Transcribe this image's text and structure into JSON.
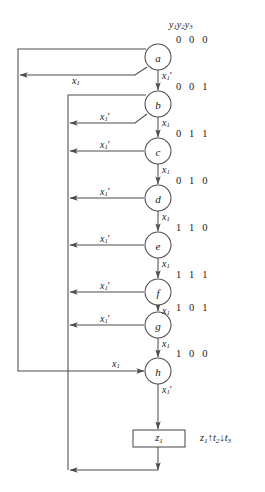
{
  "header": {
    "state_vars": "y1y2y3"
  },
  "nodes": [
    {
      "id": "a",
      "label": "a",
      "code": "0 0 0",
      "cx": 158,
      "cy": 57,
      "r": 13
    },
    {
      "id": "b",
      "label": "b",
      "code": "0 0 1",
      "cx": 158,
      "cy": 104,
      "r": 13
    },
    {
      "id": "c",
      "label": "c",
      "code": "0 1 1",
      "cx": 158,
      "cy": 151,
      "r": 13
    },
    {
      "id": "d",
      "label": "d",
      "code": "0 1 0",
      "cx": 158,
      "cy": 198,
      "r": 13
    },
    {
      "id": "e",
      "label": "e",
      "code": "1 1 0",
      "cx": 158,
      "cy": 245,
      "r": 13
    },
    {
      "id": "f",
      "label": "f",
      "code": "1 1 1",
      "cx": 158,
      "cy": 292,
      "r": 13
    },
    {
      "id": "g",
      "label": "g",
      "code": "1 0 1",
      "cx": 158,
      "cy": 325,
      "r": 13
    },
    {
      "id": "h",
      "label": "h",
      "code": "1 0 0",
      "cx": 158,
      "cy": 371,
      "r": 13
    }
  ],
  "output_box": {
    "label": "z1",
    "x": 133,
    "y": 430,
    "w": 52,
    "h": 17
  },
  "annotation": {
    "text": "z1 up t2 down t3",
    "z": "z",
    "zsub": "1",
    "t2": "t",
    "t2sub": "2",
    "t3": "t",
    "t3sub": "3",
    "up": "↑",
    "down": "↓"
  },
  "edge_labels": {
    "a_to_b": "x1'",
    "a_back": "x1",
    "b_to_c": "x1",
    "b_back": "x1'",
    "c_to_d": "x1",
    "c_back": "x1'",
    "d_to_e": "x1",
    "d_back": "x1'",
    "e_to_f": "x1",
    "e_back": "x1'",
    "f_to_g": "x1",
    "f_back": "x1'",
    "g_to_h": "x1",
    "g_back": "x1'",
    "h_to_z": "x1'",
    "h_in": "x1"
  },
  "colors": {
    "stroke": "#4d4d4d",
    "text": "#1a1a1a",
    "background": "#ffffff"
  }
}
